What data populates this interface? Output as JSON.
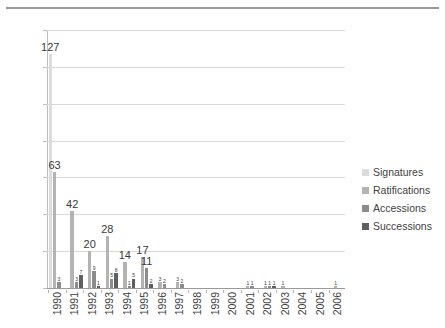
{
  "chart_data": {
    "type": "bar",
    "title": "",
    "subtitle": "",
    "xlabel": "",
    "ylabel": "",
    "ylim": [
      0,
      140
    ],
    "ytick_step": 20,
    "yticks": [
      0,
      20,
      40,
      60,
      80,
      100,
      120,
      140
    ],
    "grid": true,
    "legend_position": "right",
    "categories": [
      "1990",
      "1991",
      "1992",
      "1993",
      "1994",
      "1995",
      "1996",
      "1997",
      "1998",
      "1999",
      "2000",
      "2001",
      "2002",
      "2003",
      "2004",
      "2005",
      "2006"
    ],
    "series": [
      {
        "name": "Signatures",
        "color": "#dcdcdc",
        "values": [
          127,
          0,
          0,
          0,
          0,
          0,
          0,
          0,
          0,
          0,
          0,
          0,
          0,
          0,
          0,
          0,
          0
        ]
      },
      {
        "name": "Ratifications",
        "color": "#b3b3b3",
        "values": [
          63,
          42,
          20,
          28,
          14,
          17,
          3,
          3,
          0,
          0,
          0,
          1,
          1,
          1,
          0,
          0,
          1
        ]
      },
      {
        "name": "Accessions",
        "color": "#8c8c8c",
        "values": [
          3,
          3,
          9,
          5,
          1,
          11,
          2,
          2,
          0,
          0,
          0,
          1,
          1,
          0,
          0,
          0,
          0
        ]
      },
      {
        "name": "Successions",
        "color": "#5f5f5f",
        "values": [
          0,
          7,
          1,
          8,
          5,
          2,
          0,
          0,
          0,
          0,
          0,
          0,
          1,
          0,
          0,
          0,
          0
        ]
      }
    ],
    "extra_group_values": {
      "1992": {
        "note": "fourth small bar",
        "value": 2
      }
    },
    "data_labels": {
      "1990": [
        "127",
        "63",
        "3"
      ],
      "1991": [
        "3",
        "7"
      ],
      "1992": [
        "20",
        "9",
        "1",
        "2"
      ],
      "1993": [
        "28",
        "5",
        "8",
        "4"
      ],
      "1994": [
        "14",
        "1",
        "5"
      ],
      "1995": [
        "17",
        "11",
        "2"
      ],
      "1996": [
        "3",
        "2"
      ],
      "1997": [
        "3",
        "2"
      ],
      "2001": [
        "1",
        "1"
      ],
      "2002": [
        "1",
        "1"
      ],
      "2003": [
        "1"
      ],
      "2006": [
        "1"
      ]
    }
  },
  "legend": {
    "items": [
      {
        "label": "Signatures",
        "color": "#dcdcdc"
      },
      {
        "label": "Ratifications",
        "color": "#b3b3b3"
      },
      {
        "label": "Accessions",
        "color": "#8c8c8c"
      },
      {
        "label": "Successions",
        "color": "#5f5f5f"
      }
    ]
  }
}
